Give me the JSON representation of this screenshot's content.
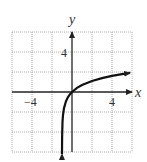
{
  "chart_data": {
    "type": "line",
    "title": "",
    "xlabel": "x",
    "ylabel": "y",
    "xlim": [
      -6,
      6
    ],
    "ylim": [
      -6,
      6
    ],
    "grid": true,
    "grid_step": 2,
    "x_tick_labels": [
      "-4",
      "4"
    ],
    "y_tick_labels": [
      "4"
    ],
    "series": [
      {
        "name": "y = ln(x+1)",
        "x": [
          -0.998,
          -0.99,
          -0.95,
          -0.9,
          -0.8,
          -0.6,
          -0.4,
          -0.2,
          0,
          0.5,
          1,
          2,
          3,
          4,
          5,
          5.8
        ],
        "y": [
          -6.2,
          -4.6,
          -3.0,
          -2.3,
          -1.61,
          -0.92,
          -0.51,
          -0.22,
          0,
          0.41,
          0.69,
          1.1,
          1.39,
          1.61,
          1.79,
          1.92
        ]
      }
    ],
    "annotations": [
      "arrow at upper-right end",
      "arrow at lower end (vertical asymptote x = -1)"
    ]
  },
  "labels": {
    "x_axis": "x",
    "y_axis": "y",
    "x_neg_tick": "−4",
    "x_pos_tick": "4",
    "y_pos_tick": "4"
  }
}
